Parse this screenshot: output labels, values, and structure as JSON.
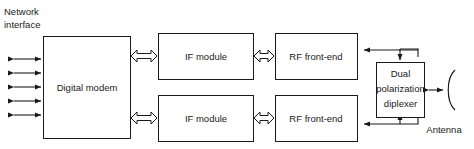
{
  "diagram": {
    "colors": {
      "background": "#ffffff",
      "stroke": "#1a1a1a",
      "fill": "#ffffff"
    },
    "labels": {
      "network_interface_line1": "Network",
      "network_interface_line2": "interface",
      "antenna": "Antenna"
    },
    "blocks": [
      {
        "id": "digital-modem",
        "label": "Digital modem",
        "x": 43,
        "y": 36,
        "w": 87,
        "h": 102
      },
      {
        "id": "if-module-top",
        "label": "IF module",
        "x": 158,
        "y": 33,
        "w": 95,
        "h": 46
      },
      {
        "id": "if-module-bottom",
        "label": "IF module",
        "x": 158,
        "y": 95,
        "w": 95,
        "h": 46
      },
      {
        "id": "rf-front-end-top",
        "label": "RF front-end",
        "x": 275,
        "y": 33,
        "w": 82,
        "h": 46
      },
      {
        "id": "rf-front-end-bottom",
        "label": "RF front-end",
        "x": 275,
        "y": 95,
        "w": 82,
        "h": 46
      },
      {
        "id": "dual-polarization-diplexer",
        "label_line1": "Dual",
        "label_line2": "polarization",
        "label_line3": "diplexer",
        "x": 376,
        "y": 62,
        "w": 48,
        "h": 55
      }
    ],
    "network_arrows": {
      "count": 5,
      "description": "five bidirectional network interface arrows"
    },
    "block_arrows": [
      {
        "id": "modem-to-if-top",
        "description": "bidirectional block arrow between digital modem and top IF module"
      },
      {
        "id": "modem-to-if-bottom",
        "description": "bidirectional block arrow between digital modem and bottom IF module"
      },
      {
        "id": "if-to-rf-top",
        "description": "bidirectional block arrow between top IF module and top RF front-end"
      },
      {
        "id": "if-to-rf-bottom",
        "description": "bidirectional block arrow between bottom IF module and bottom RF front-end"
      }
    ],
    "connectors": [
      {
        "id": "diplexer-to-rf-top",
        "description": "line from diplexer top into top RF front-end"
      },
      {
        "id": "diplexer-to-rf-bottom",
        "description": "line from diplexer bottom into bottom RF front-end"
      },
      {
        "id": "diplexer-to-antenna",
        "description": "bidirectional link from diplexer to antenna dish"
      }
    ]
  }
}
